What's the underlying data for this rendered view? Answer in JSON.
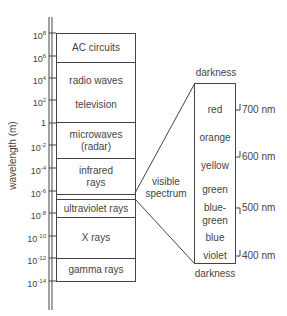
{
  "axis": {
    "label": "wavelength (m)",
    "ticks": [
      "10^8",
      "10^6",
      "10^4",
      "10^2",
      "1",
      "10^-2",
      "10^-4",
      "10^-6",
      "10^-8",
      "10^-10",
      "10^-12",
      "10^-14"
    ]
  },
  "bands": [
    {
      "label": "AC circuits"
    },
    {
      "label": "radio waves",
      "sub": "television"
    },
    {
      "label": "microwaves",
      "sub": "(radar)"
    },
    {
      "label": "infrared",
      "sub": "rays"
    },
    {
      "label": ""
    },
    {
      "label": "ultraviolet rays"
    },
    {
      "label": "X rays"
    },
    {
      "label": "gamma rays"
    }
  ],
  "visible": {
    "label_line1": "visible",
    "label_line2": "spectrum",
    "top": "darkness",
    "bottom": "darkness",
    "colors": [
      "red",
      "orange",
      "yellow",
      "green",
      "blue-",
      "green",
      "blue",
      "violet"
    ],
    "nm_ticks": [
      "700 nm",
      "600 nm",
      "500 nm",
      "400 nm"
    ]
  }
}
